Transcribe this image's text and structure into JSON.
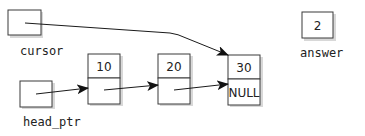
{
  "diagram": {
    "variables": {
      "cursor": {
        "label": "cursor",
        "points_to": "node-30"
      },
      "head_ptr": {
        "label": "head_ptr",
        "points_to": "node-10"
      },
      "answer": {
        "label": "answer",
        "value": "2"
      }
    },
    "nodes": [
      {
        "id": "node-10",
        "data": "10",
        "link": "node-20"
      },
      {
        "id": "node-20",
        "data": "20",
        "link": "node-30"
      },
      {
        "id": "node-30",
        "data": "30",
        "link": "NULL"
      }
    ]
  }
}
